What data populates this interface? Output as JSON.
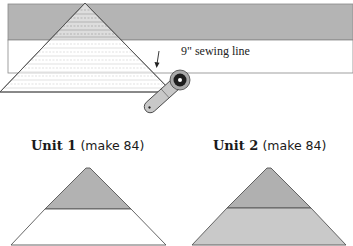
{
  "diagram": {
    "top_illustration": {
      "sewing_line_label": "9\" sewing line",
      "strip_set": {
        "dark_band_color": "#b4b4b4",
        "light_band_color": "#ffffff"
      },
      "template_triangle": {
        "description": "Triangle ruler/template laid on strip set with dashed guide lines",
        "fill": "#ffffff",
        "guide_line_color": "#c8c8c8"
      },
      "tool": "rotary cutter",
      "arrow": "points to sewing line at triangle edge"
    },
    "units": [
      {
        "name": "Unit 1",
        "number_label": "Unit 1",
        "quantity_label": "(make 84)",
        "top_color": "#b2b2b2",
        "bottom_color": "#ffffff"
      },
      {
        "name": "Unit 2",
        "number_label": "Unit 2",
        "quantity_label": "(make 84)",
        "top_color": "#b0b0b0",
        "bottom_color": "#c9c9c9"
      }
    ]
  }
}
